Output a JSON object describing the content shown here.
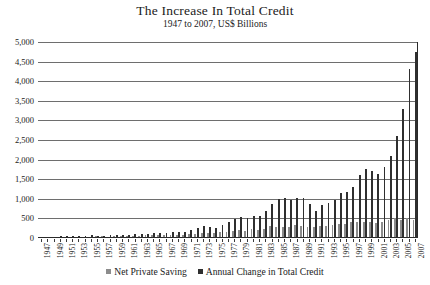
{
  "chart_data": {
    "type": "bar",
    "title": "The Increase In Total Credit",
    "subtitle": "1947 to 2007, US$ Billions",
    "xlabel": "",
    "ylabel": "",
    "ylim": [
      0,
      5000
    ],
    "ytick_step": 500,
    "grid": true,
    "legend_position": "bottom",
    "ytick_labels": [
      "5,000",
      "4,500",
      "4,000",
      "3,500",
      "3,000",
      "2,500",
      "2,000",
      "1,500",
      "1,000",
      "500",
      "0"
    ],
    "ytick_values": [
      5000,
      4500,
      4000,
      3500,
      3000,
      2500,
      2000,
      1500,
      1000,
      500,
      0
    ],
    "categories": [
      "1947",
      "1948",
      "1949",
      "1950",
      "1951",
      "1952",
      "1953",
      "1954",
      "1955",
      "1956",
      "1957",
      "1958",
      "1959",
      "1960",
      "1961",
      "1962",
      "1963",
      "1964",
      "1965",
      "1966",
      "1967",
      "1968",
      "1969",
      "1970",
      "1971",
      "1972",
      "1973",
      "1974",
      "1975",
      "1976",
      "1977",
      "1978",
      "1979",
      "1980",
      "1981",
      "1982",
      "1983",
      "1984",
      "1985",
      "1986",
      "1987",
      "1988",
      "1989",
      "1990",
      "1991",
      "1992",
      "1993",
      "1994",
      "1995",
      "1996",
      "1997",
      "1998",
      "1999",
      "2000",
      "2001",
      "2002",
      "2003",
      "2004",
      "2005",
      "2006",
      "2007"
    ],
    "xtick_labels_shown": [
      "1947",
      "1949",
      "1951",
      "1953",
      "1955",
      "1957",
      "1959",
      "1961",
      "1963",
      "1965",
      "1967",
      "1969",
      "1971",
      "1973",
      "1975",
      "1977",
      "1979",
      "1981",
      "1983",
      "1985",
      "1987",
      "1989",
      "1991",
      "1993",
      "1995",
      "1997",
      "1999",
      "2001",
      "2003",
      "2005",
      "2007"
    ],
    "series": [
      {
        "name": "Net Private Saving",
        "color": "#8c8c8c",
        "values": [
          18,
          26,
          20,
          28,
          30,
          31,
          30,
          29,
          38,
          40,
          39,
          35,
          47,
          44,
          47,
          56,
          58,
          67,
          78,
          82,
          84,
          84,
          82,
          80,
          100,
          113,
          137,
          121,
          125,
          143,
          163,
          191,
          207,
          190,
          230,
          195,
          230,
          316,
          290,
          270,
          275,
          320,
          300,
          280,
          280,
          300,
          300,
          330,
          350,
          370,
          400,
          420,
          400,
          400,
          380,
          420,
          470,
          500,
          470,
          520,
          450
        ]
      },
      {
        "name": "Annual Change in Total Credit",
        "color": "#2f2f2f",
        "values": [
          20,
          24,
          18,
          40,
          45,
          48,
          45,
          50,
          68,
          60,
          58,
          70,
          85,
          70,
          85,
          95,
          105,
          110,
          125,
          125,
          135,
          165,
          165,
          160,
          215,
          250,
          300,
          280,
          265,
          325,
          400,
          480,
          530,
          500,
          560,
          560,
          700,
          880,
          1000,
          1030,
          960,
          1020,
          1010,
          870,
          700,
          830,
          900,
          960,
          1150,
          1180,
          1300,
          1600,
          1750,
          1700,
          1640,
          1800,
          2100,
          2600,
          3300,
          4300,
          4750
        ]
      }
    ]
  },
  "legend": {
    "items": [
      {
        "label": "Net Private Saving",
        "color": "#8c8c8c"
      },
      {
        "label": "Annual Change in Total Credit",
        "color": "#2f2f2f"
      }
    ]
  }
}
